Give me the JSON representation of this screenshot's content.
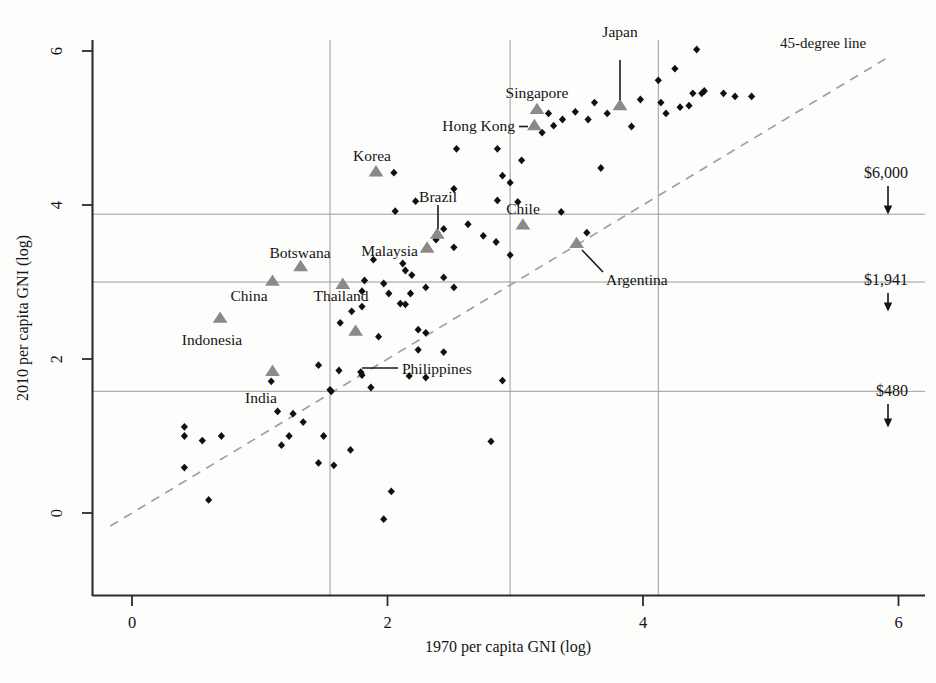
{
  "chart_data": {
    "type": "scatter",
    "title": "",
    "xlabel": "1970 per capita GNI (log)",
    "ylabel": "2010 per capita GNI (log)",
    "xlim": [
      -0.3,
      6.15
    ],
    "ylim": [
      -0.45,
      6.25
    ],
    "xticks": [
      0,
      2,
      4,
      6
    ],
    "xtick_labels": [
      "0",
      "2",
      "4",
      "6"
    ],
    "yticks": [
      0,
      2,
      4,
      6
    ],
    "ytick_labels": [
      "0",
      "2",
      "4",
      "6"
    ],
    "grid": "reference-lines-only",
    "legend": "none",
    "reference_lines": {
      "horizontal": [
        {
          "y": 3.88,
          "label": "$6,000"
        },
        {
          "y": 3.0,
          "label": "$1,941"
        },
        {
          "y": 1.58,
          "label": "$480"
        }
      ],
      "vertical": [
        {
          "x": 1.55
        },
        {
          "x": 2.96
        },
        {
          "x": 4.12
        }
      ]
    },
    "diagonal": {
      "label": "45-degree line",
      "from": [
        -0.17,
        -0.17
      ],
      "to": [
        5.9,
        5.9
      ],
      "style": "dashed"
    },
    "series": [
      {
        "name": "Highlighted economies",
        "marker": "triangle",
        "color": "#8a8a8a",
        "points": [
          {
            "label": "Japan",
            "x": 3.82,
            "y": 5.29
          },
          {
            "label": "Singapore",
            "x": 3.17,
            "y": 5.24
          },
          {
            "label": "Hong Kong",
            "x": 3.15,
            "y": 5.03
          },
          {
            "label": "Korea",
            "x": 1.91,
            "y": 4.43
          },
          {
            "label": "Brazil",
            "x": 2.39,
            "y": 3.62
          },
          {
            "label": "Chile",
            "x": 3.06,
            "y": 3.74
          },
          {
            "label": "Argentina",
            "x": 3.48,
            "y": 3.5
          },
          {
            "label": "Malaysia",
            "x": 2.31,
            "y": 3.44
          },
          {
            "label": "Botswana",
            "x": 1.32,
            "y": 3.2
          },
          {
            "label": "China",
            "x": 1.1,
            "y": 3.01
          },
          {
            "label": "Thailand",
            "x": 1.65,
            "y": 2.97
          },
          {
            "label": "Indonesia",
            "x": 0.69,
            "y": 2.53
          },
          {
            "label": "Philippines",
            "x": 1.75,
            "y": 2.36
          },
          {
            "label": "India",
            "x": 1.1,
            "y": 1.84
          }
        ]
      },
      {
        "name": "Other economies",
        "marker": "diamond",
        "color": "#101010",
        "points": [
          {
            "x": 4.42,
            "y": 6.02
          },
          {
            "x": 4.25,
            "y": 5.77
          },
          {
            "x": 4.12,
            "y": 5.62
          },
          {
            "x": 4.48,
            "y": 5.48
          },
          {
            "x": 4.63,
            "y": 5.45
          },
          {
            "x": 4.39,
            "y": 5.45
          },
          {
            "x": 4.46,
            "y": 5.45
          },
          {
            "x": 4.85,
            "y": 5.41
          },
          {
            "x": 4.72,
            "y": 5.41
          },
          {
            "x": 3.98,
            "y": 5.37
          },
          {
            "x": 3.62,
            "y": 5.33
          },
          {
            "x": 4.14,
            "y": 5.33
          },
          {
            "x": 4.36,
            "y": 5.29
          },
          {
            "x": 4.29,
            "y": 5.27
          },
          {
            "x": 3.47,
            "y": 5.21
          },
          {
            "x": 3.72,
            "y": 5.19
          },
          {
            "x": 3.26,
            "y": 5.19
          },
          {
            "x": 4.18,
            "y": 5.19
          },
          {
            "x": 3.37,
            "y": 5.11
          },
          {
            "x": 3.57,
            "y": 5.11
          },
          {
            "x": 2.05,
            "y": 4.42
          },
          {
            "x": 3.3,
            "y": 5.03
          },
          {
            "x": 3.91,
            "y": 5.02
          },
          {
            "x": 3.21,
            "y": 4.94
          },
          {
            "x": 2.54,
            "y": 4.73
          },
          {
            "x": 2.86,
            "y": 4.73
          },
          {
            "x": 3.05,
            "y": 4.58
          },
          {
            "x": 3.67,
            "y": 4.48
          },
          {
            "x": 2.9,
            "y": 4.38
          },
          {
            "x": 2.96,
            "y": 4.29
          },
          {
            "x": 2.52,
            "y": 4.21
          },
          {
            "x": 2.86,
            "y": 4.06
          },
          {
            "x": 3.02,
            "y": 4.04
          },
          {
            "x": 2.22,
            "y": 4.05
          },
          {
            "x": 2.06,
            "y": 3.92
          },
          {
            "x": 3.36,
            "y": 3.91
          },
          {
            "x": 2.63,
            "y": 3.75
          },
          {
            "x": 2.44,
            "y": 3.69
          },
          {
            "x": 3.56,
            "y": 3.64
          },
          {
            "x": 2.75,
            "y": 3.6
          },
          {
            "x": 2.38,
            "y": 3.55
          },
          {
            "x": 2.85,
            "y": 3.52
          },
          {
            "x": 2.52,
            "y": 3.45
          },
          {
            "x": 2.96,
            "y": 3.35
          },
          {
            "x": 1.89,
            "y": 3.29
          },
          {
            "x": 2.12,
            "y": 3.24
          },
          {
            "x": 2.14,
            "y": 3.15
          },
          {
            "x": 2.19,
            "y": 3.09
          },
          {
            "x": 2.44,
            "y": 3.06
          },
          {
            "x": 1.82,
            "y": 3.02
          },
          {
            "x": 1.97,
            "y": 2.98
          },
          {
            "x": 2.3,
            "y": 2.93
          },
          {
            "x": 2.52,
            "y": 2.93
          },
          {
            "x": 1.8,
            "y": 2.88
          },
          {
            "x": 2.01,
            "y": 2.85
          },
          {
            "x": 2.18,
            "y": 2.85
          },
          {
            "x": 2.1,
            "y": 2.72
          },
          {
            "x": 2.14,
            "y": 2.71
          },
          {
            "x": 1.8,
            "y": 2.68
          },
          {
            "x": 1.72,
            "y": 2.62
          },
          {
            "x": 1.63,
            "y": 2.47
          },
          {
            "x": 2.24,
            "y": 2.38
          },
          {
            "x": 2.3,
            "y": 2.34
          },
          {
            "x": 1.93,
            "y": 2.29
          },
          {
            "x": 2.24,
            "y": 2.12
          },
          {
            "x": 2.44,
            "y": 2.09
          },
          {
            "x": 1.46,
            "y": 1.92
          },
          {
            "x": 1.62,
            "y": 1.85
          },
          {
            "x": 1.79,
            "y": 1.83
          },
          {
            "x": 1.8,
            "y": 1.79
          },
          {
            "x": 2.17,
            "y": 1.78
          },
          {
            "x": 2.3,
            "y": 1.76
          },
          {
            "x": 2.9,
            "y": 1.72
          },
          {
            "x": 1.09,
            "y": 1.71
          },
          {
            "x": 1.87,
            "y": 1.63
          },
          {
            "x": 1.55,
            "y": 1.6
          },
          {
            "x": 1.56,
            "y": 1.58
          },
          {
            "x": 1.14,
            "y": 1.32
          },
          {
            "x": 1.26,
            "y": 1.29
          },
          {
            "x": 1.34,
            "y": 1.18
          },
          {
            "x": 0.41,
            "y": 1.12
          },
          {
            "x": 0.41,
            "y": 1.0
          },
          {
            "x": 0.7,
            "y": 1.0
          },
          {
            "x": 1.23,
            "y": 1.0
          },
          {
            "x": 1.5,
            "y": 1.0
          },
          {
            "x": 0.55,
            "y": 0.94
          },
          {
            "x": 2.81,
            "y": 0.93
          },
          {
            "x": 1.17,
            "y": 0.88
          },
          {
            "x": 1.71,
            "y": 0.82
          },
          {
            "x": 1.46,
            "y": 0.65
          },
          {
            "x": 1.58,
            "y": 0.62
          },
          {
            "x": 0.41,
            "y": 0.59
          },
          {
            "x": 2.03,
            "y": 0.28
          },
          {
            "x": 0.6,
            "y": 0.17
          },
          {
            "x": 1.97,
            "y": -0.08
          }
        ]
      }
    ],
    "callouts": [
      {
        "label": "Japan",
        "leader": "vertical"
      },
      {
        "label": "Hong Kong",
        "leader": "horizontal"
      },
      {
        "label": "Brazil",
        "leader": "vertical"
      },
      {
        "label": "Philippines",
        "leader": "horizontal"
      },
      {
        "label": "Argentina",
        "leader": "diagonal"
      }
    ],
    "annotations": [
      "45-degree line",
      "$6,000",
      "$1,941",
      "$480"
    ]
  },
  "axes": {
    "x_title": "1970 per capita GNI (log)",
    "y_title": "2010 per capita GNI (log)",
    "x_ticks": [
      "0",
      "2",
      "4",
      "6"
    ],
    "y_ticks": [
      "0",
      "2",
      "4",
      "6"
    ]
  },
  "annotations": {
    "diagonal_note": "45-degree line",
    "ref_6000": "$6,000",
    "ref_1941": "$1,941",
    "ref_480": "$480"
  },
  "labels": {
    "japan": "Japan",
    "singapore": "Singapore",
    "hong_kong": "Hong Kong",
    "korea": "Korea",
    "brazil": "Brazil",
    "chile": "Chile",
    "argentina": "Argentina",
    "malaysia": "Malaysia",
    "botswana": "Botswana",
    "china": "China",
    "thailand": "Thailand",
    "indonesia": "Indonesia",
    "philippines": "Philippines",
    "india": "India"
  },
  "colors": {
    "highlight_marker": "#8a8a8a",
    "dot_marker": "#101010",
    "axis": "#2b2b2b",
    "reference_line": "#9a9a9a",
    "diagonal": "#a0a0a0",
    "background": "#fdfdfc"
  }
}
